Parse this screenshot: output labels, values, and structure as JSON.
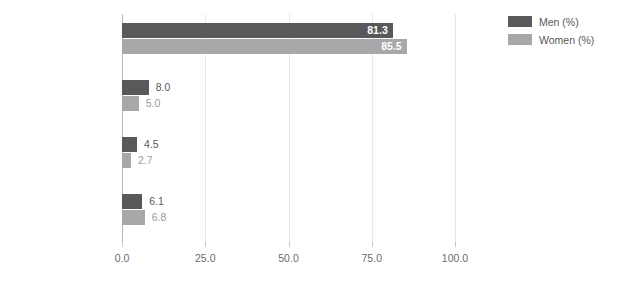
{
  "chart_data": {
    "type": "bar",
    "orientation": "horizontal",
    "title": "",
    "xlabel": "",
    "ylabel": "",
    "xlim": [
      0.0,
      100.0
    ],
    "xticks": [
      "0.0",
      "25.0",
      "50.0",
      "75.0",
      "100.0"
    ],
    "xtick_values": [
      0,
      25,
      50,
      75,
      100
    ],
    "grid": true,
    "grid_axis": "x",
    "legend_position": "top-right",
    "categories": [
      "Employed",
      "Self-employed",
      "Employed other",
      "Unemployed"
    ],
    "series": [
      {
        "name": "Men (%)",
        "color": "#59595b",
        "values": [
          81.3,
          8.0,
          4.5,
          6.1
        ],
        "labels": [
          "81.3",
          "8.0",
          "4.5",
          "6.1"
        ]
      },
      {
        "name": "Women (%)",
        "color": "#a8a8aa",
        "values": [
          85.5,
          5.0,
          2.7,
          6.8
        ],
        "labels": [
          "85.5",
          "5.0",
          "2.7",
          "6.8"
        ]
      }
    ]
  },
  "legend": {
    "items": [
      {
        "label": "Men (%)",
        "color": "#59595b"
      },
      {
        "label": "Women (%)",
        "color": "#a8a8aa"
      }
    ]
  },
  "colors": {
    "men": "#59595b",
    "women": "#a8a8aa",
    "grid": "#e9e9ea",
    "axis": "#b9b9bb",
    "text": "#58585a",
    "value_outside": "#9a9a9c",
    "value_inside": "#ffffff"
  }
}
